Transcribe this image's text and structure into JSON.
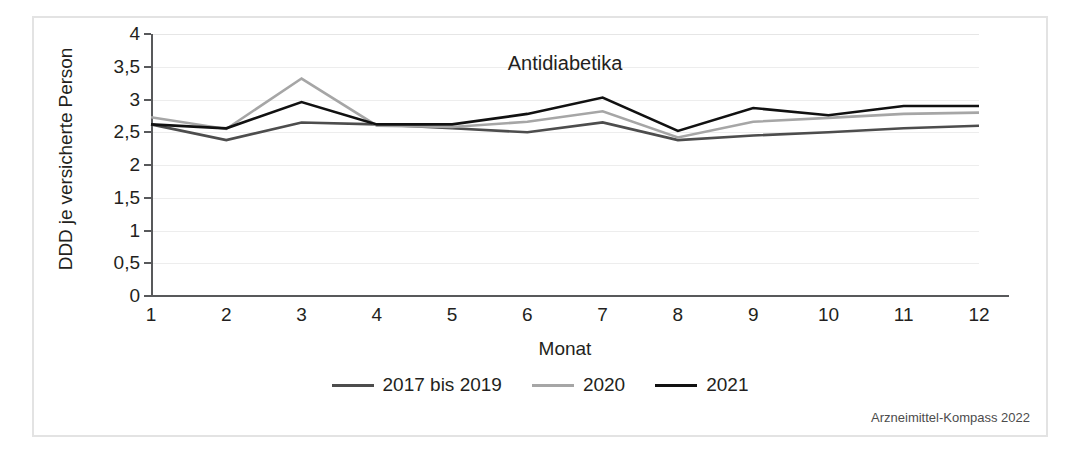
{
  "chart_data": {
    "type": "line",
    "title": "Antidiabetika",
    "xlabel": "Monat",
    "ylabel": "DDD je versicherte Person",
    "categories": [
      "1",
      "2",
      "3",
      "4",
      "5",
      "6",
      "7",
      "8",
      "9",
      "10",
      "11",
      "12"
    ],
    "x": [
      1,
      2,
      3,
      4,
      5,
      6,
      7,
      8,
      9,
      10,
      11,
      12
    ],
    "ylim": [
      0,
      4
    ],
    "xlim": [
      1,
      12
    ],
    "ytick_labels": [
      "0",
      "0,5",
      "1",
      "1,5",
      "2",
      "2,5",
      "3",
      "3,5",
      "4"
    ],
    "ytick_values": [
      0,
      0.5,
      1,
      1.5,
      2,
      2.5,
      3,
      3.5,
      4
    ],
    "grid": true,
    "legend_position": "bottom",
    "series": [
      {
        "name": "2017 bis 2019",
        "color": "#4d4d4d",
        "values": [
          2.62,
          2.38,
          2.65,
          2.62,
          2.56,
          2.5,
          2.65,
          2.38,
          2.45,
          2.5,
          2.56,
          2.6
        ]
      },
      {
        "name": "2020",
        "color": "#a6a6a6",
        "values": [
          2.73,
          2.55,
          3.32,
          2.6,
          2.58,
          2.66,
          2.82,
          2.42,
          2.66,
          2.72,
          2.78,
          2.8
        ]
      },
      {
        "name": "2021",
        "color": "#111111",
        "values": [
          2.62,
          2.56,
          2.96,
          2.62,
          2.62,
          2.78,
          3.03,
          2.52,
          2.87,
          2.76,
          2.9,
          2.9
        ]
      }
    ]
  },
  "source_note": "Arzneimittel-Kompass 2022"
}
